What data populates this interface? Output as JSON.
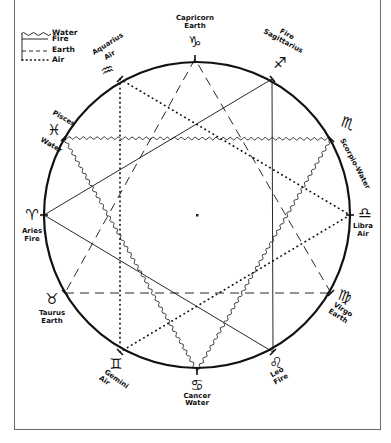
{
  "diagram": {
    "type": "zodiac-element-triangles",
    "legend": [
      {
        "element": "Water",
        "line_style": "wavy"
      },
      {
        "element": "Fire",
        "line_style": "solid"
      },
      {
        "element": "Earth",
        "line_style": "dashed"
      },
      {
        "element": "Air",
        "line_style": "dotted"
      }
    ],
    "signs": [
      {
        "name": "Capricorn",
        "element": "Earth",
        "glyph": "♑"
      },
      {
        "name": "Sagittarius",
        "element": "Fire",
        "glyph": "♐"
      },
      {
        "name": "Scorpio",
        "element": "Water",
        "glyph": "♏"
      },
      {
        "name": "Libra",
        "element": "Air",
        "glyph": "♎"
      },
      {
        "name": "Virgo",
        "element": "Earth",
        "glyph": "♍"
      },
      {
        "name": "Leo",
        "element": "Fire",
        "glyph": "♌"
      },
      {
        "name": "Cancer",
        "element": "Water",
        "glyph": "♋"
      },
      {
        "name": "Gemini",
        "element": "Air",
        "glyph": "♊"
      },
      {
        "name": "Taurus",
        "element": "Earth",
        "glyph": "♉"
      },
      {
        "name": "Aries",
        "element": "Fire",
        "glyph": "♈"
      },
      {
        "name": "Pisces",
        "element": "Water",
        "glyph": "♓"
      },
      {
        "name": "Aquarius",
        "element": "Air",
        "glyph": "♒"
      }
    ],
    "triangles": [
      {
        "element": "Water",
        "vertices": [
          "Pisces",
          "Scorpio",
          "Cancer"
        ]
      },
      {
        "element": "Fire",
        "vertices": [
          "Aries",
          "Sagittarius",
          "Leo"
        ]
      },
      {
        "element": "Earth",
        "vertices": [
          "Capricorn",
          "Taurus",
          "Virgo"
        ]
      },
      {
        "element": "Air",
        "vertices": [
          "Aquarius",
          "Libra",
          "Gemini"
        ]
      }
    ]
  },
  "legend_labels": {
    "water": "Water",
    "fire": "Fire",
    "earth": "Earth",
    "air": "Air"
  },
  "labels": {
    "capricorn": {
      "name": "Capricorn",
      "element": "Earth",
      "glyph": "♑"
    },
    "sagittarius": {
      "name": "Sagittarius",
      "element": "Fire",
      "glyph": "♐"
    },
    "scorpio": {
      "text": "Scorpio-Water",
      "glyph": "♏"
    },
    "libra": {
      "name": "Libra",
      "element": "Air",
      "glyph": "♎"
    },
    "virgo": {
      "name": "Virgo",
      "element": "Earth",
      "glyph": "♍"
    },
    "leo": {
      "name": "Leo",
      "element": "Fire",
      "glyph": "♌"
    },
    "cancer": {
      "name": "Cancer",
      "element": "Water",
      "glyph": "♋"
    },
    "gemini": {
      "name": "Gemini",
      "element": "Air",
      "glyph": "♊"
    },
    "taurus": {
      "name": "Taurus",
      "element": "Earth",
      "glyph": "♉"
    },
    "aries": {
      "name": "Aries",
      "element": "Fire",
      "glyph": "♈"
    },
    "pisces": {
      "name": "Pisces",
      "element": "Water",
      "glyph": "♓"
    },
    "aquarius": {
      "name": "Aquarius",
      "element": "Air",
      "glyph": "♒"
    }
  },
  "colors": {
    "ink": "#111111",
    "frame": "#6a6a6a",
    "background": "#ffffff"
  }
}
